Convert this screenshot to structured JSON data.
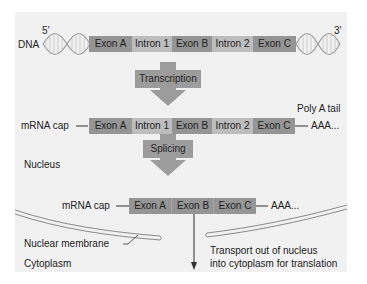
{
  "dna": {
    "label": "DNA",
    "five_prime": "5′",
    "three_prime": "3′",
    "segments": [
      {
        "label": "Exon A",
        "type": "exon"
      },
      {
        "label": "Intron 1",
        "type": "intron"
      },
      {
        "label": "Exon B",
        "type": "exon"
      },
      {
        "label": "Intron 2",
        "type": "intron"
      },
      {
        "label": "Exon C",
        "type": "exon"
      }
    ]
  },
  "steps": {
    "transcription": "Transcription",
    "splicing": "Splicing"
  },
  "pre_mrna": {
    "cap_label": "mRNA cap",
    "tail_label": "Poly A tail",
    "tail_text": "AAA...",
    "segments": [
      {
        "label": "Exon A",
        "type": "exon"
      },
      {
        "label": "Intron 1",
        "type": "intron"
      },
      {
        "label": "Exon B",
        "type": "exon"
      },
      {
        "label": "Intron 2",
        "type": "intron"
      },
      {
        "label": "Exon C",
        "type": "exon"
      }
    ]
  },
  "mature_mrna": {
    "cap_label": "mRNA cap",
    "tail_text": "AAA...",
    "segments": [
      {
        "label": "Exon A",
        "type": "exon"
      },
      {
        "label": "Exon B",
        "type": "exon"
      },
      {
        "label": "Exon C",
        "type": "exon"
      }
    ]
  },
  "regions": {
    "nucleus": "Nucleus",
    "nuclear_membrane": "Nuclear membrane",
    "cytoplasm": "Cytoplasm"
  },
  "transport": {
    "line1": "Transport out of nucleus",
    "line2": "into cytoplasm for translation"
  },
  "colors": {
    "exon": "#959595",
    "intron": "#bdbdbd",
    "arrow": "#9c9c9c",
    "panel": "#f1f1f1"
  }
}
